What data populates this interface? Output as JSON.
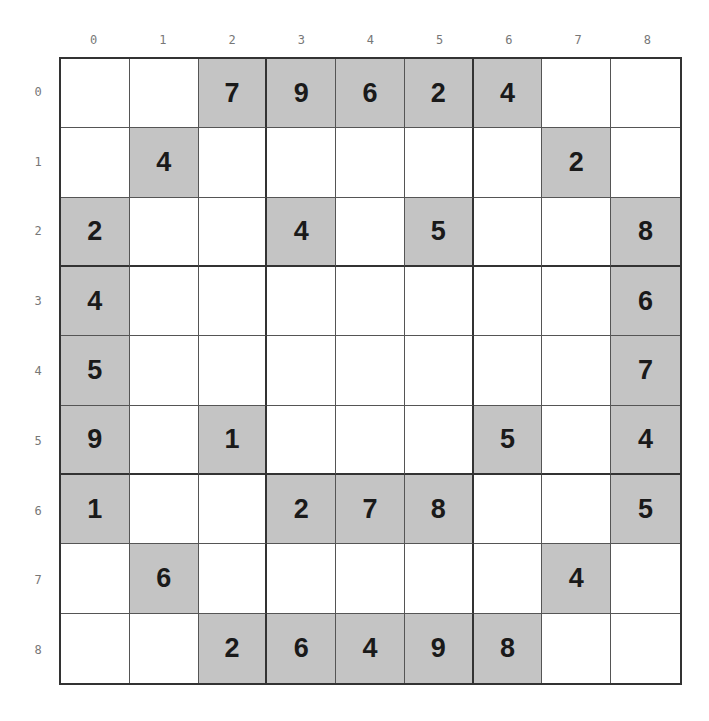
{
  "columns": [
    "0",
    "1",
    "2",
    "3",
    "4",
    "5",
    "6",
    "7",
    "8"
  ],
  "rows": [
    "0",
    "1",
    "2",
    "3",
    "4",
    "5",
    "6",
    "7",
    "8"
  ],
  "colors": {
    "given_bg": "#c4c4c4",
    "empty_bg": "#ffffff",
    "digit": "#1a1a1a"
  },
  "grid": [
    [
      "",
      "",
      "7",
      "9",
      "6",
      "2",
      "4",
      "",
      ""
    ],
    [
      "",
      "4",
      "",
      "",
      "",
      "",
      "",
      "2",
      ""
    ],
    [
      "2",
      "",
      "",
      "4",
      "",
      "5",
      "",
      "",
      "8"
    ],
    [
      "4",
      "",
      "",
      "",
      "",
      "",
      "",
      "",
      "6"
    ],
    [
      "5",
      "",
      "",
      "",
      "",
      "",
      "",
      "",
      "7"
    ],
    [
      "9",
      "",
      "1",
      "",
      "",
      "",
      "5",
      "",
      "4"
    ],
    [
      "1",
      "",
      "",
      "2",
      "7",
      "8",
      "",
      "",
      "5"
    ],
    [
      "",
      "6",
      "",
      "",
      "",
      "",
      "",
      "4",
      ""
    ],
    [
      "",
      "",
      "2",
      "6",
      "4",
      "9",
      "8",
      "",
      ""
    ]
  ]
}
